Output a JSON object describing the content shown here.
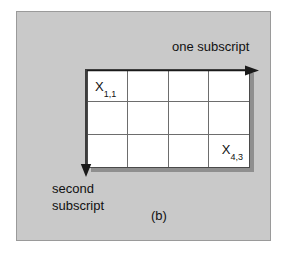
{
  "figure": {
    "caption": "(b)",
    "background_color": "#c9c9c9",
    "border_color": "#9a9a9a",
    "grid_background": "#ffffff",
    "grid_line_color": "#6d6d6d",
    "shadow_color": "#8f8f8f",
    "text_color": "#111111"
  },
  "axes": {
    "horizontal": {
      "label": "one subscript",
      "direction": "right",
      "arrow_icon": "arrow-right-icon"
    },
    "vertical": {
      "label_line1": "second",
      "label_line2": "subscript",
      "direction": "down",
      "arrow_icon": "arrow-down-icon"
    }
  },
  "matrix": {
    "columns": 4,
    "rows": 3,
    "cells": [
      {
        "base": "X",
        "subscript": "1,1",
        "position": "top-left"
      },
      {
        "base": "X",
        "subscript": "4,3",
        "position": "bottom-right"
      }
    ],
    "first_cell_base": "X",
    "first_cell_subscript": "1,1",
    "last_cell_base": "X",
    "last_cell_subscript": "4,3"
  }
}
